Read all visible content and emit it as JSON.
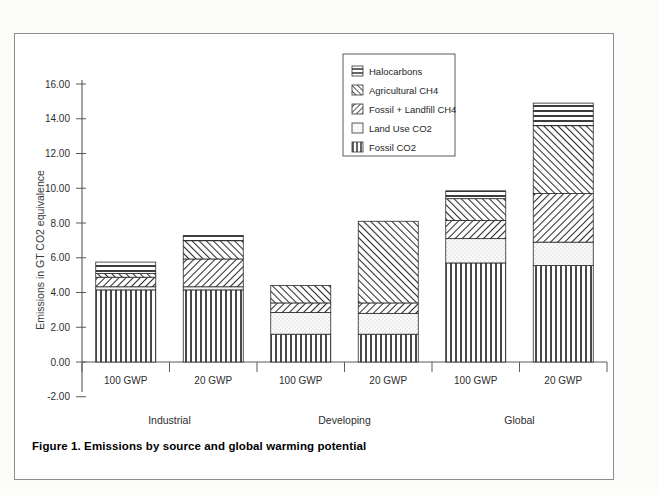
{
  "figure": {
    "caption": "Figure 1. Emissions by source and global warming potential"
  },
  "legend": {
    "position": "top-center-right",
    "items": [
      {
        "label": "Halocarbons",
        "pattern": "horizontal-lines"
      },
      {
        "label": "Agricultural CH4",
        "pattern": "diagonal-hatch-up"
      },
      {
        "label": "Fossil + Landfill CH4",
        "pattern": "diagonal-hatch-down"
      },
      {
        "label": "Land Use CO2",
        "pattern": "light-dots"
      },
      {
        "label": "Fossil CO2",
        "pattern": "vertical-lines"
      }
    ]
  },
  "axes": {
    "ylabel": "Emissions in GT CO2 equivalence",
    "yticks": [
      "-2.00",
      "0.00",
      "2.00",
      "4.00",
      "6.00",
      "8.00",
      "10.00",
      "12.00",
      "14.00",
      "16.00"
    ],
    "ymin": -2.0,
    "ymax": 16.0,
    "xticklabels": [
      "100 GWP",
      "20 GWP",
      "100 GWP",
      "20 GWP",
      "100 GWP",
      "20 GWP"
    ],
    "grouplabels": [
      "Industrial",
      "Developing",
      "Global"
    ]
  },
  "chart_data": {
    "type": "bar",
    "title": "Figure 1. Emissions by source and global warming potential",
    "xlabel": "",
    "ylabel": "Emissions in GT CO2 equivalence",
    "ylim": [
      -2.0,
      16.0
    ],
    "grid": false,
    "stacked": true,
    "legend_position": "upper center",
    "categories": [
      "100 GWP",
      "20 GWP",
      "100 GWP",
      "20 GWP",
      "100 GWP",
      "20 GWP"
    ],
    "groups": [
      {
        "name": "Industrial",
        "categories": [
          "100 GWP",
          "20 GWP"
        ]
      },
      {
        "name": "Developing",
        "categories": [
          "100 GWP",
          "20 GWP"
        ]
      },
      {
        "name": "Global",
        "categories": [
          "100 GWP",
          "20 GWP"
        ]
      }
    ],
    "series": [
      {
        "name": "Fossil CO2",
        "values": [
          4.15,
          4.15,
          1.6,
          1.6,
          5.7,
          5.55
        ]
      },
      {
        "name": "Land Use CO2",
        "values": [
          0.18,
          0.18,
          1.25,
          1.2,
          1.4,
          1.35
        ]
      },
      {
        "name": "Fossil + Landfill CH4",
        "values": [
          0.55,
          1.6,
          0.55,
          0.6,
          1.05,
          2.8
        ]
      },
      {
        "name": "Agricultural CH4",
        "values": [
          0.22,
          1.05,
          1.0,
          4.7,
          1.25,
          3.9
        ]
      },
      {
        "name": "Halocarbons",
        "values": [
          0.65,
          0.3,
          0.0,
          0.0,
          0.45,
          1.3
        ]
      }
    ],
    "totals": [
      5.75,
      7.28,
      4.4,
      8.1,
      9.85,
      14.9
    ]
  }
}
